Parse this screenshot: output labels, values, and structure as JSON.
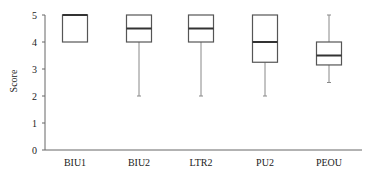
{
  "chart_data": {
    "type": "boxplot",
    "title": "",
    "xlabel": "",
    "ylabel": "Score",
    "ylim": [
      0,
      5
    ],
    "yticks": [
      0,
      1,
      2,
      3,
      4,
      5
    ],
    "grid": false,
    "legend": null,
    "categories": [
      "BIU1",
      "BIU2",
      "LTR2",
      "PU2",
      "PEOU"
    ],
    "series": [
      {
        "name": "BIU1",
        "whisker_low": 4,
        "q1": 4,
        "median": 5,
        "q3": 5,
        "whisker_high": 5
      },
      {
        "name": "BIU2",
        "whisker_low": 2,
        "q1": 4,
        "median": 4.5,
        "q3": 5,
        "whisker_high": 5
      },
      {
        "name": "LTR2",
        "whisker_low": 2,
        "q1": 4,
        "median": 4.5,
        "q3": 5,
        "whisker_high": 5
      },
      {
        "name": "PU2",
        "whisker_low": 2,
        "q1": 3.25,
        "median": 4,
        "q3": 5,
        "whisker_high": 5
      },
      {
        "name": "PEOU",
        "whisker_low": 2.5,
        "q1": 3.15,
        "median": 3.5,
        "q3": 4,
        "whisker_high": 5
      }
    ]
  },
  "colors": {
    "box_stroke": "#555555",
    "median_stroke": "#333333",
    "axis": "#666666",
    "whisker": "#888888"
  }
}
